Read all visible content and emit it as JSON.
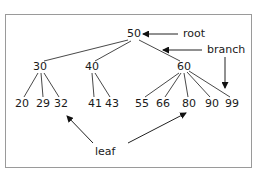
{
  "diagram": {
    "type": "tree",
    "title": "",
    "nodes": {
      "root": {
        "id": "n50",
        "label": "50",
        "x": 134,
        "y": 34
      },
      "level1": [
        {
          "id": "n30",
          "label": "30",
          "x": 40,
          "y": 67
        },
        {
          "id": "n40",
          "label": "40",
          "x": 92,
          "y": 67
        },
        {
          "id": "n60",
          "label": "60",
          "x": 184,
          "y": 67
        }
      ],
      "leaves": [
        {
          "id": "n20",
          "label": "20",
          "x": 22,
          "y": 104,
          "parent": "n30"
        },
        {
          "id": "n29",
          "label": "29",
          "x": 43,
          "y": 104,
          "parent": "n30"
        },
        {
          "id": "n32",
          "label": "32",
          "x": 61,
          "y": 104,
          "parent": "n30"
        },
        {
          "id": "n41",
          "label": "41",
          "x": 95,
          "y": 104,
          "parent": "n40"
        },
        {
          "id": "n43",
          "label": "43",
          "x": 112,
          "y": 104,
          "parent": "n40"
        },
        {
          "id": "n55",
          "label": "55",
          "x": 142,
          "y": 104,
          "parent": "n60"
        },
        {
          "id": "n66",
          "label": "66",
          "x": 163,
          "y": 104,
          "parent": "n60"
        },
        {
          "id": "n80",
          "label": "80",
          "x": 189,
          "y": 104,
          "parent": "n60"
        },
        {
          "id": "n90",
          "label": "90",
          "x": 212,
          "y": 104,
          "parent": "n60"
        },
        {
          "id": "n99",
          "label": "99",
          "x": 232,
          "y": 104,
          "parent": "n60"
        }
      ]
    },
    "annotations": {
      "root": {
        "label": "root",
        "x": 183,
        "y": 34
      },
      "branch": {
        "label": "branch",
        "x": 207,
        "y": 50
      },
      "leaf": {
        "label": "leaf",
        "x": 95,
        "y": 152
      }
    },
    "colors": {
      "line": "#333333",
      "text": "#1a1a1a",
      "border": "#9a9a9a"
    }
  }
}
